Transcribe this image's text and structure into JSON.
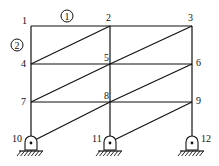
{
  "diagram": {
    "type": "frame-truss",
    "nodes": [
      {
        "id": "1",
        "x": 31,
        "y": 26,
        "lx": 22,
        "ly": 24
      },
      {
        "id": "2",
        "x": 110,
        "y": 26,
        "lx": 106,
        "ly": 21
      },
      {
        "id": "3",
        "x": 192,
        "y": 26,
        "lx": 188,
        "ly": 21
      },
      {
        "id": "4",
        "x": 31,
        "y": 64,
        "lx": 21,
        "ly": 67
      },
      {
        "id": "5",
        "x": 110,
        "y": 64,
        "lx": 104,
        "ly": 61
      },
      {
        "id": "6",
        "x": 192,
        "y": 64,
        "lx": 196,
        "ly": 66
      },
      {
        "id": "7",
        "x": 31,
        "y": 102,
        "lx": 21,
        "ly": 105
      },
      {
        "id": "8",
        "x": 110,
        "y": 102,
        "lx": 104,
        "ly": 99
      },
      {
        "id": "9",
        "x": 192,
        "y": 102,
        "lx": 196,
        "ly": 104
      },
      {
        "id": "10",
        "x": 31,
        "y": 142,
        "lx": 12,
        "ly": 142
      },
      {
        "id": "11",
        "x": 110,
        "y": 142,
        "lx": 92,
        "ly": 142
      },
      {
        "id": "12",
        "x": 192,
        "y": 142,
        "lx": 201,
        "ly": 142
      }
    ],
    "members": [
      [
        "1",
        "2"
      ],
      [
        "2",
        "3"
      ],
      [
        "4",
        "5"
      ],
      [
        "5",
        "6"
      ],
      [
        "7",
        "8"
      ],
      [
        "8",
        "9"
      ],
      [
        "1",
        "4"
      ],
      [
        "4",
        "7"
      ],
      [
        "7",
        "10"
      ],
      [
        "2",
        "5"
      ],
      [
        "5",
        "8"
      ],
      [
        "8",
        "11"
      ],
      [
        "3",
        "6"
      ],
      [
        "6",
        "9"
      ],
      [
        "9",
        "12"
      ],
      [
        "4",
        "2"
      ],
      [
        "5",
        "3"
      ],
      [
        "7",
        "5"
      ],
      [
        "8",
        "6"
      ],
      [
        "10",
        "8"
      ],
      [
        "11",
        "9"
      ]
    ],
    "element_labels": [
      {
        "text": "1",
        "x": 67,
        "y": 16
      },
      {
        "text": "2",
        "x": 17,
        "y": 45
      }
    ],
    "supports": [
      "10",
      "11",
      "12"
    ]
  }
}
